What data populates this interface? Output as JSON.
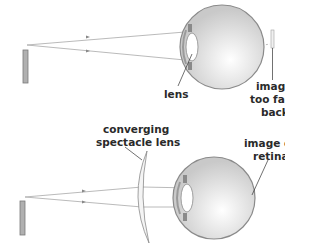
{
  "diagram": {
    "top_panel": {
      "labels": {
        "lens": "lens",
        "image_line1": "image",
        "image_line2": "too far",
        "image_line3": "back"
      }
    },
    "bottom_panel": {
      "labels": {
        "spectacle_line1": "converging",
        "spectacle_line2": "spectacle lens",
        "image_line1": "image on",
        "image_line2": "retina"
      }
    },
    "colors": {
      "eye_fill": "#d9d9d9",
      "eye_outline": "#8a8a8a",
      "object_fill": "#b0b0b0",
      "ray": "#a0a0a0",
      "text": "#2a2a2a"
    }
  }
}
